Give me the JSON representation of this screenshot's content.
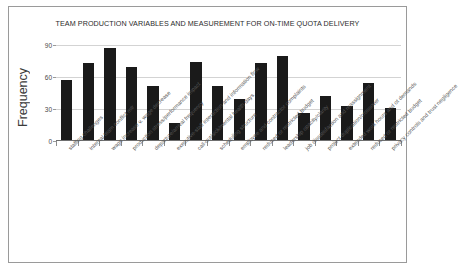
{
  "chart_data": {
    "type": "bar",
    "title": "TEAM PRODUCTION VARIABLES AND MEASUREMENT FOR ON-TIME QUOTA DELIVERY",
    "xlabel": "",
    "ylabel": "Frequency",
    "ylim": [
      0,
      90
    ],
    "yticks": [
      0,
      30,
      60,
      90
    ],
    "grid": true,
    "legend": "none",
    "bar_color": "#1a1a1a",
    "categories": [
      "staffing challenges",
      "internal team conflict mtr",
      "wage increase v. wage decrease",
      "production stress/performance impact",
      "departure/arrival frequency",
      "executive-staff interaction and information flow",
      "call-out/sick/mental health days",
      "scheduling structure",
      "employee and contractor complaints",
      "reduced or restricted budget",
      "leadership opacity/clarity",
      "job dissatisfaction and reassignment",
      "project duplication/crossover",
      "extended work hours and ot demands",
      "reduced or restricted budget",
      "privacy controls and trust negligence"
    ],
    "values": [
      57,
      73,
      87,
      69,
      52,
      17,
      74,
      52,
      39,
      73,
      80,
      26,
      42,
      33,
      54,
      31
    ]
  }
}
